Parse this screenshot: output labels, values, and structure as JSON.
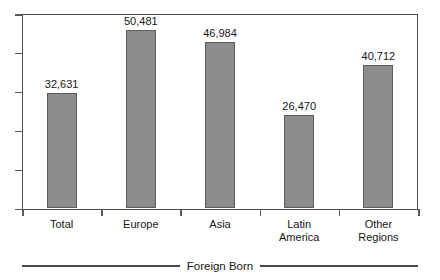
{
  "caption": "Foreign Born",
  "chart_data": {
    "type": "bar",
    "title": "",
    "subtitle": "",
    "xlabel": "Foreign Born",
    "ylabel": "",
    "categories": [
      "Total",
      "Europe",
      "Asia",
      "Latin America",
      "Other Regions"
    ],
    "values": [
      32631,
      46984,
      50481,
      26470,
      40712
    ],
    "bars": [
      {
        "category": "Total",
        "label_line1": "Total",
        "label_line2": "",
        "value": 32631,
        "value_label": "32,631"
      },
      {
        "category": "Europe",
        "label_line1": "Europe",
        "label_line2": "",
        "value": 50481,
        "value_label": "50,481"
      },
      {
        "category": "Asia",
        "label_line1": "Asia",
        "label_line2": "",
        "value": 46984,
        "value_label": "46,984"
      },
      {
        "category": "Latin America",
        "label_line1": "Latin",
        "label_line2": "America",
        "value": 26470,
        "value_label": "26,470"
      },
      {
        "category": "Other Regions",
        "label_line1": "Other",
        "label_line2": "Regions",
        "value": 40712,
        "value_label": "40,712"
      }
    ],
    "ylim": [
      0,
      55000
    ],
    "y_tick_values": [
      0,
      11000,
      22000,
      33000,
      44000,
      55000
    ],
    "y_tick_labels": [
      "",
      "",
      "",
      "",
      "",
      ""
    ],
    "grid": false,
    "legend": null,
    "bar_color": "#8c8c8c",
    "bar_border_color": "#5d5d5d",
    "axis_color": "#4a4a4a",
    "text_color": "#161616"
  }
}
